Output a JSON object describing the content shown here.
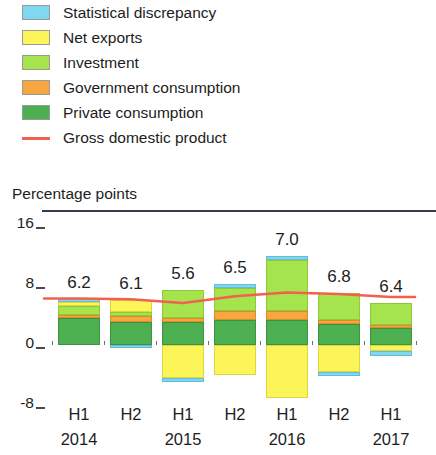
{
  "legend": {
    "items": [
      {
        "label": "Statistical discrepancy",
        "swatch": "legend-swatch-statistical-discrepancy",
        "color": "#7fd7f0",
        "kind": "box"
      },
      {
        "label": "Net exports",
        "swatch": "legend-swatch-net-exports",
        "color": "#fbf55a",
        "kind": "box"
      },
      {
        "label": "Investment",
        "swatch": "legend-swatch-investment",
        "color": "#a5e44d",
        "kind": "box"
      },
      {
        "label": "Government consumption",
        "swatch": "legend-swatch-government-consumption",
        "color": "#f7a73f",
        "kind": "box"
      },
      {
        "label": "Private consumption",
        "swatch": "legend-swatch-private-consumption",
        "color": "#4caf50",
        "kind": "box"
      },
      {
        "label": "Gross domestic product",
        "swatch": "legend-line-gross-domestic-product",
        "color": "#f4604f",
        "kind": "line"
      }
    ]
  },
  "chart_data": {
    "type": "bar",
    "subtype": "stacked-bar-with-line-overlay",
    "title": "",
    "ylabel": "Percentage points",
    "xlabel": "",
    "ylim": [
      -8,
      16
    ],
    "yticks": [
      16,
      8,
      0,
      -8
    ],
    "ytick_labels": [
      "16",
      "8",
      "0",
      "-8"
    ],
    "grid": false,
    "legend_position": "top",
    "categories": [
      "H1",
      "H2",
      "H1",
      "H2",
      "H1",
      "H2",
      "H1"
    ],
    "period_labels": [
      "H1",
      "H2",
      "H1",
      "H2",
      "H1",
      "H2",
      "H1"
    ],
    "year_labels": [
      "2014",
      "",
      "2015",
      "",
      "2016",
      "",
      "2017"
    ],
    "year_label_positions": [
      0,
      2,
      4,
      6
    ],
    "series": [
      {
        "name": "Private consumption",
        "color": "#4caf50",
        "values": [
          3.6,
          3.1,
          3.1,
          3.3,
          3.3,
          2.8,
          2.3
        ]
      },
      {
        "name": "Government consumption",
        "color": "#f7a73f",
        "values": [
          0.4,
          0.8,
          0.5,
          1.3,
          1.3,
          0.5,
          0.4
        ]
      },
      {
        "name": "Investment",
        "color": "#a5e44d",
        "values": [
          1.2,
          0.5,
          3.7,
          3.0,
          6.8,
          3.7,
          2.9
        ]
      },
      {
        "name": "Net exports",
        "color": "#fbf55a",
        "values": [
          0.6,
          1.6,
          -4.4,
          -4.0,
          -7.0,
          -3.6,
          -0.8
        ]
      },
      {
        "name": "Statistical discrepancy",
        "color": "#7fd7f0",
        "values": [
          0.4,
          -0.4,
          -0.5,
          0.5,
          0.5,
          -0.5,
          -0.6
        ]
      }
    ],
    "line_series": {
      "name": "Gross domestic product",
      "color": "#f4604f",
      "values": [
        6.2,
        6.1,
        5.6,
        6.5,
        7.0,
        6.8,
        6.4
      ]
    },
    "data_labels": [
      "6.2",
      "6.1",
      "5.6",
      "6.5",
      "7.0",
      "6.8",
      "6.4"
    ]
  }
}
